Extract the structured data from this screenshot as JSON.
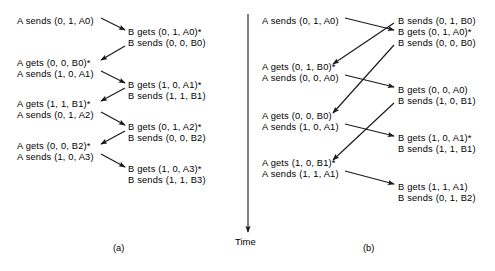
{
  "figure": {
    "stroke_color": "#1a1a1a",
    "text_color": "#000000",
    "background": "#ffffff"
  },
  "time_axis": {
    "label": "Time",
    "direction": "downward",
    "x": 248,
    "y_start": 14,
    "y_end": 232
  },
  "panels": [
    {
      "id": "a",
      "caption": "(a)",
      "caption_x": 113,
      "caption_y": 243,
      "left_column_x": 17,
      "right_column_x": 128,
      "events": [
        {
          "text": "A sends (0, 1, A0)",
          "side": "left",
          "x": 17,
          "y": 16
        },
        {
          "text": "B gets (0, 1, A0)*",
          "side": "right",
          "x": 128,
          "y": 27
        },
        {
          "text": "B sends (0, 0, B0)",
          "side": "right",
          "x": 128,
          "y": 38
        },
        {
          "text": "A gets (0, 0, B0)*",
          "side": "left",
          "x": 17,
          "y": 58
        },
        {
          "text": "A sends (1, 0, A1)",
          "side": "left",
          "x": 17,
          "y": 69
        },
        {
          "text": "B gets (1, 0, A1)*",
          "side": "right",
          "x": 128,
          "y": 80
        },
        {
          "text": "B sends (1, 1, B1)",
          "side": "right",
          "x": 128,
          "y": 91
        },
        {
          "text": "A gets (1, 1, B1)*",
          "side": "left",
          "x": 17,
          "y": 99
        },
        {
          "text": "A sends (0, 1, A2)",
          "side": "left",
          "x": 17,
          "y": 110
        },
        {
          "text": "B gets (0, 1, A2)*",
          "side": "right",
          "x": 128,
          "y": 122
        },
        {
          "text": "B sends (0, 0, B2)",
          "side": "right",
          "x": 128,
          "y": 133
        },
        {
          "text": "A gets (0, 0, B2)*",
          "side": "left",
          "x": 17,
          "y": 141
        },
        {
          "text": "A sends (1, 0, A3)",
          "side": "left",
          "x": 17,
          "y": 152
        },
        {
          "text": "B gets (1, 0, A3)*",
          "side": "right",
          "x": 128,
          "y": 164
        },
        {
          "text": "B sends (1, 1, B3)",
          "side": "right",
          "x": 128,
          "y": 175
        }
      ],
      "arrows": [
        {
          "from": "A sends (0, 1, A0)",
          "to": "B gets (0, 1, A0)*",
          "x1": 101,
          "y1": 18,
          "x2": 125,
          "y2": 30
        },
        {
          "from": "B sends (0, 0, B0)",
          "to": "A gets (0, 0, B0)*",
          "x1": 125,
          "y1": 46,
          "x2": 101,
          "y2": 60
        },
        {
          "from": "A sends (1, 0, A1)",
          "to": "B gets (1, 0, A1)*",
          "x1": 101,
          "y1": 71,
          "x2": 125,
          "y2": 83
        },
        {
          "from": "B sends (1, 1, B1)",
          "to": "A gets (1, 1, B1)*",
          "x1": 125,
          "y1": 88,
          "x2": 101,
          "y2": 101
        },
        {
          "from": "A sends (0, 1, A2)",
          "to": "B gets (0, 1, A2)*",
          "x1": 101,
          "y1": 112,
          "x2": 125,
          "y2": 125
        },
        {
          "from": "B sends (0, 0, B2)",
          "to": "A gets (0, 0, B2)*",
          "x1": 125,
          "y1": 131,
          "x2": 101,
          "y2": 144
        },
        {
          "from": "A sends (1, 0, A3)",
          "to": "B gets (1, 0, A3)*",
          "x1": 101,
          "y1": 154,
          "x2": 125,
          "y2": 167
        }
      ]
    },
    {
      "id": "b",
      "caption": "(b)",
      "caption_x": 363,
      "caption_y": 243,
      "left_column_x": 262,
      "right_column_x": 398,
      "events": [
        {
          "text": "A sends (0, 1, A0)",
          "side": "left",
          "x": 262,
          "y": 16
        },
        {
          "text": "B sends (0, 1, B0)",
          "side": "right",
          "x": 398,
          "y": 16
        },
        {
          "text": "B gets (0, 1, A0)*",
          "side": "right",
          "x": 398,
          "y": 27
        },
        {
          "text": "B sends (0, 0, B0)",
          "side": "right",
          "x": 398,
          "y": 38
        },
        {
          "text": "A gets (0, 1, B0)*",
          "side": "left",
          "x": 262,
          "y": 62
        },
        {
          "text": "A sends (0, 0, A0)",
          "side": "left",
          "x": 262,
          "y": 73
        },
        {
          "text": "B gets (0, 0, A0)",
          "side": "right",
          "x": 398,
          "y": 85
        },
        {
          "text": "B sends (1, 0, B1)",
          "side": "right",
          "x": 398,
          "y": 96
        },
        {
          "text": "A gets (0, 0, B0)",
          "side": "left",
          "x": 262,
          "y": 111
        },
        {
          "text": "A sends (1, 0, A1)",
          "side": "left",
          "x": 262,
          "y": 122
        },
        {
          "text": "B gets (1, 0, A1)*",
          "side": "right",
          "x": 398,
          "y": 133
        },
        {
          "text": "B sends (1, 1, B1)",
          "side": "right",
          "x": 398,
          "y": 144
        },
        {
          "text": "A gets (1, 0, B1)*",
          "side": "left",
          "x": 262,
          "y": 158
        },
        {
          "text": "A sends (1, 1, A1)",
          "side": "left",
          "x": 262,
          "y": 169
        },
        {
          "text": "B gets (1, 1, A1)",
          "side": "right",
          "x": 398,
          "y": 182
        },
        {
          "text": "B sends (0, 1, B2)",
          "side": "right",
          "x": 398,
          "y": 193
        }
      ],
      "arrows": [
        {
          "from": "A sends (0, 1, A0)",
          "to": "B gets (0, 1, A0)*",
          "x1": 345,
          "y1": 18,
          "x2": 394,
          "y2": 30
        },
        {
          "from": "B sends (0, 1, B0)",
          "to": "A gets (0, 1, B0)*",
          "x1": 394,
          "y1": 23,
          "x2": 333,
          "y2": 64
        },
        {
          "from": "A sends (0, 0, A0)",
          "to": "B gets (0, 0, A0)",
          "x1": 345,
          "y1": 75,
          "x2": 394,
          "y2": 87
        },
        {
          "from": "B sends (0, 0, B0)",
          "to": "A gets (0, 0, B0)",
          "x1": 394,
          "y1": 45,
          "x2": 333,
          "y2": 113
        },
        {
          "from": "A sends (1, 0, A1)",
          "to": "B gets (1, 0, A1)*",
          "x1": 345,
          "y1": 124,
          "x2": 394,
          "y2": 136
        },
        {
          "from": "B sends (1, 0, B1)",
          "to": "A gets (1, 0, B1)*",
          "x1": 394,
          "y1": 103,
          "x2": 333,
          "y2": 160
        },
        {
          "from": "A sends (1, 1, A1)",
          "to": "B gets (1, 1, A1)",
          "x1": 345,
          "y1": 171,
          "x2": 394,
          "y2": 184
        }
      ]
    }
  ]
}
